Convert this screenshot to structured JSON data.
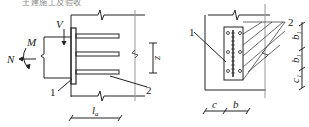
{
  "caption": "土建施工及验收",
  "left_figure": {
    "labels": {
      "V": "V",
      "M": "M",
      "N": "N",
      "z": "z",
      "la": "l",
      "la_sub": "a",
      "callout_1": "1",
      "callout_2": "2"
    }
  },
  "right_figure": {
    "labels": {
      "callout_1": "1",
      "callout_2": "2",
      "b1_top": "b",
      "b1_mid": "b",
      "c1": "c",
      "sub_1": "1",
      "c": "c",
      "b": "b"
    }
  }
}
